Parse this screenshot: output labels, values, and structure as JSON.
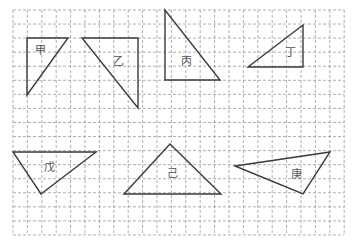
{
  "grid": {
    "origin_x": 13,
    "origin_y": 10,
    "cols": 23,
    "rows": 16,
    "step_x": 14.4,
    "step_y": 14.06,
    "line_color": "#9a9a9a"
  },
  "triangles": [
    {
      "label": "甲",
      "points": [
        [
          27,
          38
        ],
        [
          68,
          38
        ],
        [
          27,
          95
        ]
      ],
      "label_pos": [
        40,
        50
      ]
    },
    {
      "label": "乙",
      "points": [
        [
          82,
          38
        ],
        [
          138,
          38
        ],
        [
          138,
          108
        ]
      ],
      "label_pos": [
        118,
        61
      ]
    },
    {
      "label": "丙",
      "points": [
        [
          165,
          10
        ],
        [
          165,
          80
        ],
        [
          220,
          80
        ]
      ],
      "label_pos": [
        186,
        61
      ]
    },
    {
      "label": "丁",
      "points": [
        [
          303,
          25
        ],
        [
          248,
          67
        ],
        [
          303,
          67
        ]
      ],
      "label_pos": [
        290,
        52
      ]
    },
    {
      "label": "戊",
      "points": [
        [
          13,
          152
        ],
        [
          96,
          152
        ],
        [
          41,
          194
        ]
      ],
      "label_pos": [
        49,
        167
      ]
    },
    {
      "label": "己",
      "points": [
        [
          170,
          144
        ],
        [
          124,
          194
        ],
        [
          221,
          194
        ]
      ],
      "label_pos": [
        172,
        173
      ]
    },
    {
      "label": "庚",
      "points": [
        [
          235,
          166
        ],
        [
          330,
          152
        ],
        [
          303,
          194
        ]
      ],
      "label_pos": [
        296,
        174
      ]
    }
  ],
  "stroke_color": "#3a3a3a"
}
